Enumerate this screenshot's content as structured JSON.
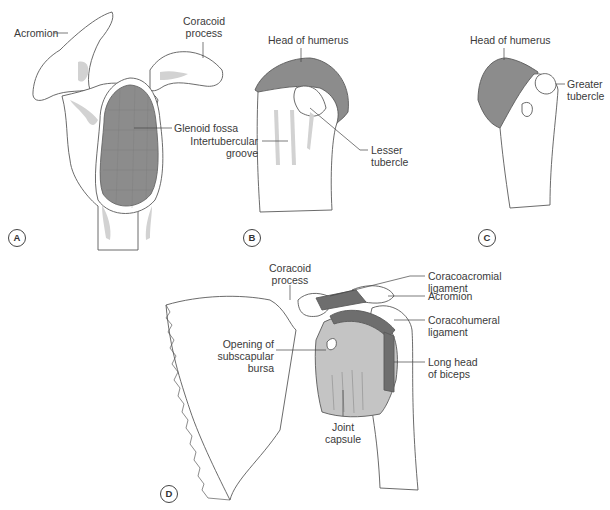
{
  "figure": {
    "panels": [
      {
        "id": "A",
        "view": "scapula-lateral",
        "labels": [
          "Acromion",
          "Coracoid process",
          "Glenoid fossa"
        ]
      },
      {
        "id": "B",
        "view": "humerus-anterior",
        "labels": [
          "Head of humerus",
          "Intertubercular groove",
          "Lesser tubercle"
        ]
      },
      {
        "id": "C",
        "view": "humerus-lateral",
        "labels": [
          "Head of humerus",
          "Greater tubercle"
        ]
      },
      {
        "id": "D",
        "view": "shoulder-joint-anterior",
        "labels": [
          "Coracoid process",
          "Coracoacromial ligament",
          "Acromion",
          "Coracohumeral ligament",
          "Opening of subscapular bursa",
          "Long head of biceps",
          "Joint capsule"
        ]
      }
    ]
  },
  "panelA": {
    "id": "A",
    "acromion": "Acromion",
    "coracoid_line1": "Coracoid",
    "coracoid_line2": "process",
    "glenoid": "Glenoid fossa"
  },
  "panelB": {
    "id": "B",
    "head": "Head of humerus",
    "groove_line1": "Intertubercular",
    "groove_line2": "groove",
    "lesser_line1": "Lesser",
    "lesser_line2": "tubercle"
  },
  "panelC": {
    "id": "C",
    "head": "Head of humerus",
    "greater_line1": "Greater",
    "greater_line2": "tubercle"
  },
  "panelD": {
    "id": "D",
    "coracoid_line1": "Coracoid",
    "coracoid_line2": "process",
    "ca_lig_line1": "Coracoacromial",
    "ca_lig_line2": "ligament",
    "acromion": "Acromion",
    "ch_lig_line1": "Coracohumeral",
    "ch_lig_line2": "ligament",
    "bursa_line1": "Opening of",
    "bursa_line2": "subscapular",
    "bursa_line3": "bursa",
    "biceps_line1": "Long head",
    "biceps_line2": "of biceps",
    "capsule_line1": "Joint",
    "capsule_line2": "capsule"
  },
  "colors": {
    "outline": "#5a5a5a",
    "shade": "#d2d2d2",
    "articular": "#8c8c8c",
    "capsule": "#c4c4c4",
    "ligament": "#6e6e6e"
  }
}
